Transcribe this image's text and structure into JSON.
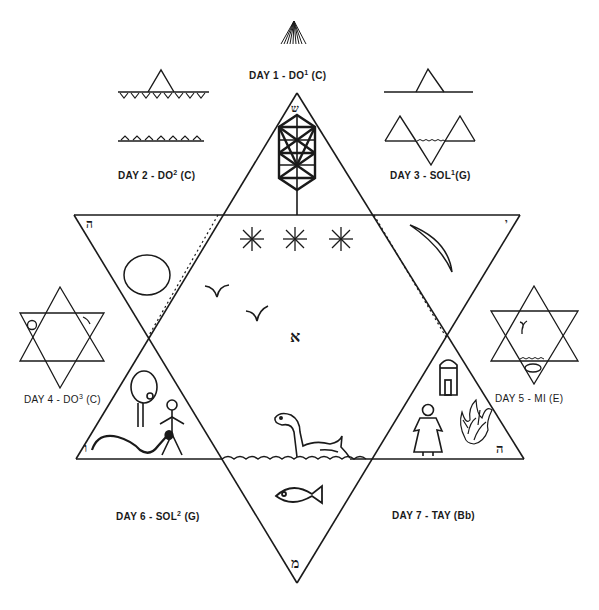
{
  "diagram": {
    "stroke_color": "#1a1a1a",
    "background": "#ffffff",
    "days": [
      {
        "id": 1,
        "prefix": "DAY 1 - DO",
        "sup": "1",
        "suffix": " (C)",
        "symbol": "radiating-light"
      },
      {
        "id": 2,
        "prefix": "DAY 2  - DO",
        "sup": "2",
        "suffix": " (C)",
        "symbol": "firmament-dividing-waters"
      },
      {
        "id": 3,
        "prefix": "DAY 3 - SOL",
        "sup": "1",
        "suffix": "(G)",
        "symbol": "land-and-seas"
      },
      {
        "id": 4,
        "prefix": "DAY 4 - DO",
        "sup": "3",
        "suffix": " (C)",
        "symbol": "sun-and-moon-hexagram"
      },
      {
        "id": 5,
        "prefix": "DAY 5 - MI (E)",
        "sup": "",
        "suffix": "",
        "symbol": "bird-and-fish-hexagram"
      },
      {
        "id": 6,
        "prefix": "DAY 6 - SOL",
        "sup": "2",
        "suffix": "  (G)",
        "symbol": "serpent-tree-man"
      },
      {
        "id": 7,
        "prefix": "DAY 7 - TAY (Bb)",
        "sup": "",
        "suffix": "",
        "symbol": "woman-house-burning-bush"
      }
    ],
    "hebrew_letters": {
      "center": "א",
      "top": "ש",
      "upper_left": "ה",
      "upper_right": "י",
      "lower_left": "ו",
      "lower_right": "ה",
      "bottom": "מ"
    },
    "central_symbols": [
      "tree-of-life",
      "three-stars",
      "sun",
      "crescent-moon",
      "two-birds",
      "sea-serpent",
      "fish",
      "waves"
    ]
  }
}
